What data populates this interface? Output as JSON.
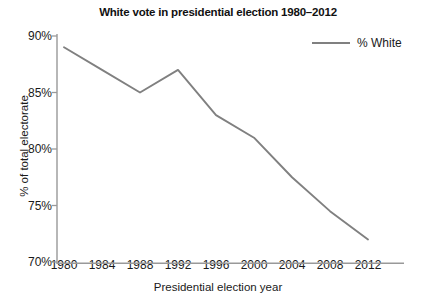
{
  "chart_data": {
    "type": "line",
    "title": "White vote in presidential election 1980–2012",
    "xlabel": "Presidential election year",
    "ylabel": "% of total electorate",
    "categories": [
      "1980",
      "1984",
      "1988",
      "1992",
      "1996",
      "2000",
      "2004",
      "2008",
      "2012"
    ],
    "x": [
      1980,
      1984,
      1988,
      1992,
      1996,
      2000,
      2004,
      2008,
      2012
    ],
    "series": [
      {
        "name": "% White",
        "color": "#808080",
        "values": [
          89,
          87,
          85,
          87,
          83,
          81,
          77.5,
          74.5,
          72
        ]
      }
    ],
    "ylim": [
      70,
      90
    ],
    "xlim": [
      1980,
      2012
    ],
    "yticks": [
      70,
      75,
      80,
      85,
      90
    ],
    "ytick_labels": [
      "70%",
      "75%",
      "80%",
      "85%",
      "90%"
    ],
    "xticks": [
      1980,
      1984,
      1988,
      1992,
      1996,
      2000,
      2004,
      2008,
      2012
    ],
    "xtick_labels": [
      "1980",
      "1984",
      "1988",
      "1992",
      "1996",
      "2000",
      "2004",
      "2008",
      "2012"
    ],
    "grid": false,
    "legend": {
      "position": "top-right",
      "entries": [
        "% White"
      ]
    },
    "axis_color": "#999999",
    "background": "#ffffff"
  },
  "legend": {
    "label": "% White"
  }
}
